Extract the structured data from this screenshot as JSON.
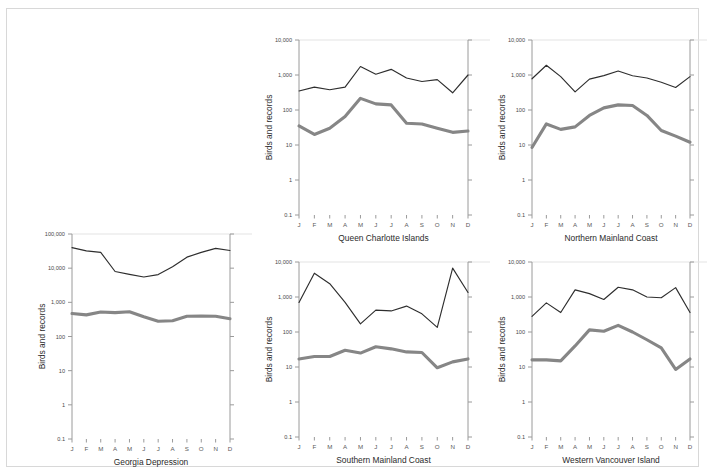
{
  "figure": {
    "background_color": "#ffffff",
    "border_color": "#d8d8d8",
    "y_axis_title": "Birds and records",
    "series_colors": {
      "records": "#2e2e2e",
      "birds": "#868686"
    }
  },
  "chart_data": [
    {
      "type": "line",
      "title": "Georgia Depression",
      "xlabel": "Georgia Depression",
      "ylabel": "Birds and records",
      "log_scale": true,
      "ylim": [
        0.1,
        100000
      ],
      "yticks": [
        0.1,
        1,
        10,
        100,
        1000,
        10000,
        100000
      ],
      "ytick_labels": [
        "0.1",
        "1",
        "10",
        "100",
        "1,000",
        "10,000",
        "100,000"
      ],
      "categories": [
        "J",
        "F",
        "M",
        "A",
        "M",
        "J",
        "J",
        "A",
        "S",
        "O",
        "N",
        "D"
      ],
      "grid": true,
      "legend": "none",
      "series": [
        {
          "name": "records",
          "style": "thin",
          "values": [
            40000,
            32000,
            29000,
            8000,
            6600,
            5500,
            6500,
            11000,
            21000,
            29000,
            38000,
            33000
          ]
        },
        {
          "name": "birds",
          "style": "thick",
          "values": [
            470,
            430,
            520,
            500,
            530,
            380,
            280,
            290,
            390,
            400,
            390,
            330
          ]
        }
      ]
    },
    {
      "type": "line",
      "title": "Queen Charlotte Islands",
      "xlabel": "Queen Charlotte Islands",
      "ylabel": "Birds and records",
      "log_scale": true,
      "ylim": [
        0.1,
        10000
      ],
      "yticks": [
        0.1,
        1,
        10,
        100,
        1000,
        10000
      ],
      "ytick_labels": [
        "0.1",
        "1",
        "10",
        "100",
        "1,000",
        "10,000"
      ],
      "categories": [
        "J",
        "F",
        "M",
        "A",
        "M",
        "J",
        "J",
        "A",
        "S",
        "O",
        "N",
        "D"
      ],
      "grid": true,
      "legend": "none",
      "series": [
        {
          "name": "records",
          "style": "thin",
          "values": [
            350,
            450,
            380,
            450,
            1750,
            1050,
            1450,
            820,
            650,
            740,
            310,
            1000
          ]
        },
        {
          "name": "birds",
          "style": "thick",
          "values": [
            35,
            20,
            30,
            65,
            215,
            150,
            140,
            42,
            40,
            30,
            23,
            25
          ]
        }
      ]
    },
    {
      "type": "line",
      "title": "Northern Mainland Coast",
      "xlabel": "Northern Mainland Coast",
      "ylabel": "Birds and records",
      "log_scale": true,
      "ylim": [
        0.1,
        10000
      ],
      "yticks": [
        0.1,
        1,
        10,
        100,
        1000,
        10000
      ],
      "ytick_labels": [
        "0.1",
        "1",
        "10",
        "100",
        "1,000",
        "10,000"
      ],
      "categories": [
        "J",
        "F",
        "M",
        "A",
        "M",
        "J",
        "J",
        "A",
        "S",
        "O",
        "N",
        "D"
      ],
      "grid": true,
      "legend": "none",
      "series": [
        {
          "name": "records",
          "style": "thin",
          "values": [
            780,
            1900,
            900,
            330,
            760,
            960,
            1300,
            950,
            820,
            620,
            440,
            900
          ]
        },
        {
          "name": "birds",
          "style": "thick",
          "values": [
            8.5,
            40,
            28,
            33,
            70,
            115,
            140,
            135,
            70,
            26,
            18,
            12
          ]
        }
      ]
    },
    {
      "type": "line",
      "title": "Southern Mainland Coast",
      "xlabel": "Southern Mainland Coast",
      "ylabel": "Birds and records",
      "log_scale": true,
      "ylim": [
        0.1,
        10000
      ],
      "yticks": [
        0.1,
        1,
        10,
        100,
        1000,
        10000
      ],
      "ytick_labels": [
        "0.1",
        "1",
        "10",
        "100",
        "1,000",
        "10,000"
      ],
      "categories": [
        "J",
        "F",
        "M",
        "A",
        "M",
        "J",
        "J",
        "A",
        "S",
        "O",
        "N",
        "D"
      ],
      "grid": true,
      "legend": "none",
      "series": [
        {
          "name": "records",
          "style": "thin",
          "values": [
            700,
            4800,
            2400,
            700,
            170,
            420,
            400,
            550,
            330,
            135,
            6700,
            1350
          ]
        },
        {
          "name": "birds",
          "style": "thick",
          "values": [
            17,
            20,
            20,
            30,
            25,
            38,
            33,
            27,
            26,
            9.5,
            14,
            17
          ]
        }
      ]
    },
    {
      "type": "line",
      "title": "Western Vancouver Island",
      "xlabel": "Western Vancouver Island",
      "ylabel": "Birds and records",
      "log_scale": true,
      "ylim": [
        0.1,
        10000
      ],
      "yticks": [
        0.1,
        1,
        10,
        100,
        1000,
        10000
      ],
      "ytick_labels": [
        "0.1",
        "1",
        "10",
        "100",
        "1,000",
        "10,000"
      ],
      "categories": [
        "J",
        "F",
        "M",
        "A",
        "M",
        "J",
        "J",
        "A",
        "S",
        "O",
        "N",
        "D"
      ],
      "grid": true,
      "legend": "none",
      "series": [
        {
          "name": "records",
          "style": "thin",
          "values": [
            280,
            680,
            360,
            1600,
            1250,
            850,
            1900,
            1600,
            1000,
            950,
            1850,
            360
          ]
        },
        {
          "name": "birds",
          "style": "thick",
          "values": [
            16,
            16,
            15,
            40,
            115,
            105,
            155,
            100,
            60,
            35,
            8.5,
            17
          ]
        }
      ]
    }
  ],
  "panels": [
    {
      "chart_index": 0,
      "left": 8,
      "top": 205,
      "width": 234,
      "height": 255,
      "plot": {
        "x0": 57,
        "y0": 20,
        "x1": 215,
        "y1": 225
      }
    },
    {
      "chart_index": 1,
      "left": 245,
      "top": 10,
      "width": 228,
      "height": 225,
      "plot": {
        "x0": 47,
        "y0": 21,
        "x1": 216,
        "y1": 196
      }
    },
    {
      "chart_index": 2,
      "left": 478,
      "top": 10,
      "width": 214,
      "height": 225,
      "plot": {
        "x0": 47,
        "y0": 21,
        "x1": 205,
        "y1": 196
      }
    },
    {
      "chart_index": 3,
      "left": 245,
      "top": 232,
      "width": 228,
      "height": 226,
      "plot": {
        "x0": 47,
        "y0": 21,
        "x1": 216,
        "y1": 196
      }
    },
    {
      "chart_index": 4,
      "left": 478,
      "top": 232,
      "width": 214,
      "height": 226,
      "plot": {
        "x0": 47,
        "y0": 21,
        "x1": 205,
        "y1": 196
      }
    }
  ]
}
